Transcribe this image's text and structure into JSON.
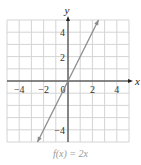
{
  "chart_data": {
    "type": "line",
    "title": "f(x) = 2x",
    "xlabel": "x",
    "ylabel": "y",
    "xlim": [
      -5,
      5
    ],
    "ylim": [
      -5,
      5
    ],
    "grid": true,
    "x_ticks": [
      -4,
      -2,
      0,
      2,
      4
    ],
    "y_ticks": [
      -4,
      2,
      4
    ],
    "x_tick_labels": [
      "−4",
      "−2",
      "0",
      "2",
      "4"
    ],
    "y_tick_labels": [
      "−4",
      "2",
      "4"
    ],
    "series": [
      {
        "name": "f(x) = 2x",
        "x": [
          -2.5,
          2.5
        ],
        "y": [
          -5,
          5
        ],
        "arrows": "both",
        "color": "#8a8a8a"
      }
    ],
    "legend": null
  },
  "colors": {
    "grid": "#d4d4d4",
    "axis": "#222222",
    "line": "#8a8a8a",
    "caption": "#9a9a9a"
  },
  "caption": "f(x) = 2x"
}
